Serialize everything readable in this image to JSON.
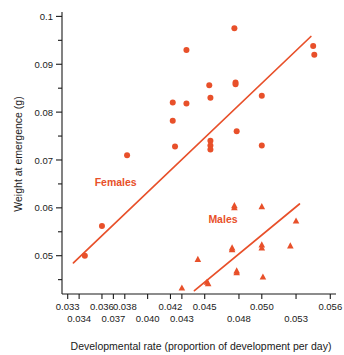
{
  "chart_data": {
    "type": "scatter",
    "title": "",
    "xlabel": "Developmental rate (proportion of development per day)",
    "ylabel": "Weight at emergence (g)",
    "xlim": [
      0.0325,
      0.0565
    ],
    "ylim": [
      0.042,
      0.1005
    ],
    "grid": false,
    "legend_position": "in-plot annotations",
    "x_tick_labels_upper": [
      "0.033",
      "0.036",
      "0.038",
      "0.042",
      "0.045",
      "0.050",
      "0.056"
    ],
    "x_tick_labels_lower": [
      "0.034",
      "0.037",
      "0.040",
      "0.043",
      "0.048",
      "0.053"
    ],
    "x_tick_values_upper": [
      0.033,
      0.036,
      0.038,
      0.042,
      0.045,
      0.05,
      0.056
    ],
    "x_tick_values_lower": [
      0.034,
      0.037,
      0.04,
      0.043,
      0.048,
      0.053
    ],
    "y_tick_labels": [
      "0.1",
      "0.09",
      "0.08",
      "0.07",
      "0.06",
      "0.05"
    ],
    "y_tick_values": [
      0.1,
      0.09,
      0.08,
      0.07,
      0.06,
      0.05
    ],
    "y_minor_ticks": [
      0.095,
      0.085,
      0.075,
      0.065,
      0.055,
      0.045
    ],
    "series": [
      {
        "name": "Females",
        "marker": "circle",
        "color": "#e8502a",
        "label_x": 0.0372,
        "label_y": 0.0645,
        "points": [
          [
            0.0345,
            0.05
          ],
          [
            0.036,
            0.0562
          ],
          [
            0.0382,
            0.071
          ],
          [
            0.0422,
            0.082
          ],
          [
            0.0422,
            0.0782
          ],
          [
            0.0424,
            0.0728
          ],
          [
            0.0434,
            0.093
          ],
          [
            0.0434,
            0.0818
          ],
          [
            0.0454,
            0.0856
          ],
          [
            0.0455,
            0.083
          ],
          [
            0.0455,
            0.074
          ],
          [
            0.0455,
            0.073
          ],
          [
            0.0455,
            0.0722
          ],
          [
            0.0476,
            0.0975
          ],
          [
            0.0477,
            0.0862
          ],
          [
            0.0477,
            0.0858
          ],
          [
            0.0478,
            0.076
          ],
          [
            0.05,
            0.0834
          ],
          [
            0.05,
            0.073
          ],
          [
            0.0545,
            0.0938
          ],
          [
            0.0546,
            0.092
          ]
        ],
        "trend_line": {
          "x1": 0.0335,
          "y1": 0.0485,
          "x2": 0.0543,
          "y2": 0.0958
        }
      },
      {
        "name": "Males",
        "marker": "triangle",
        "color": "#e8502a",
        "label_x": 0.0466,
        "label_y": 0.0568,
        "points": [
          [
            0.043,
            0.0432
          ],
          [
            0.0444,
            0.0492
          ],
          [
            0.0452,
            0.0444
          ],
          [
            0.0453,
            0.0441
          ],
          [
            0.0474,
            0.0516
          ],
          [
            0.0474,
            0.0512
          ],
          [
            0.0476,
            0.0604
          ],
          [
            0.0476,
            0.06
          ],
          [
            0.0478,
            0.0468
          ],
          [
            0.0478,
            0.0464
          ],
          [
            0.05,
            0.0602
          ],
          [
            0.05,
            0.0522
          ],
          [
            0.05,
            0.0516
          ],
          [
            0.0501,
            0.0455
          ],
          [
            0.0525,
            0.052
          ],
          [
            0.053,
            0.0572
          ]
        ],
        "trend_line": {
          "x1": 0.0441,
          "y1": 0.0427,
          "x2": 0.0533,
          "y2": 0.0608
        }
      }
    ]
  }
}
